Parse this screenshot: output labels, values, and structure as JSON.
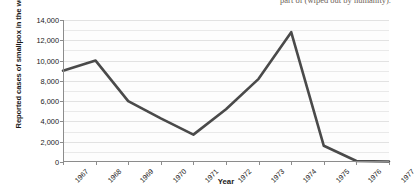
{
  "caption": {
    "fragment": "part of (wiped out by humanity)."
  },
  "chart_data": {
    "type": "line",
    "title": "",
    "xlabel": "Year",
    "ylabel": "Reported cases of smallpox in the world",
    "categories": [
      "1967",
      "1968",
      "1969",
      "1970",
      "1971",
      "1972",
      "1973",
      "1974",
      "1975",
      "1976",
      "1977"
    ],
    "values": [
      9000,
      10000,
      6000,
      4300,
      2700,
      5200,
      8200,
      12800,
      1600,
      100,
      50
    ],
    "ylim": [
      0,
      14000
    ],
    "ytick_values": [
      0,
      2000,
      4000,
      6000,
      8000,
      10000,
      12000,
      14000
    ],
    "ytick_labels": [
      "0",
      "2,000",
      "4,000",
      "6,000",
      "8,000",
      "10,000",
      "12,000",
      "14,000"
    ],
    "minor_gridlines": true,
    "grid": true,
    "legend": "none",
    "series_color": "#4a4a4a"
  }
}
